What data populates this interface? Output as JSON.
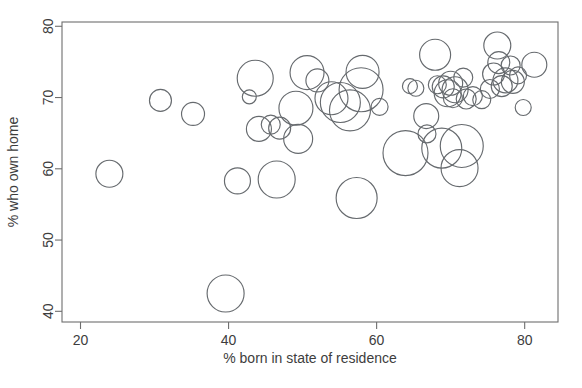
{
  "chart_data": {
    "type": "scatter",
    "title": "",
    "xlabel": "% born in state of residence",
    "ylabel": "% who own home",
    "xlim": [
      17.5,
      84.5
    ],
    "ylim": [
      38.5,
      80.6
    ],
    "xticks": [
      20,
      40,
      60,
      80
    ],
    "yticks": [
      40,
      50,
      60,
      70,
      80
    ],
    "grid": false,
    "legend": null,
    "marker": "open-circle",
    "size_encoding": "bubble radius encodes a third variable (e.g. population)",
    "points": [
      {
        "x": 23.9,
        "y": 59.3,
        "r": 13.5
      },
      {
        "x": 30.8,
        "y": 69.6,
        "r": 11.0
      },
      {
        "x": 35.2,
        "y": 67.7,
        "r": 11.5
      },
      {
        "x": 39.6,
        "y": 42.5,
        "r": 18.5
      },
      {
        "x": 41.2,
        "y": 58.3,
        "r": 13.0
      },
      {
        "x": 42.8,
        "y": 70.1,
        "r": 7.0
      },
      {
        "x": 43.6,
        "y": 72.7,
        "r": 18.0
      },
      {
        "x": 44.1,
        "y": 65.6,
        "r": 12.5
      },
      {
        "x": 45.7,
        "y": 66.2,
        "r": 9.5
      },
      {
        "x": 46.5,
        "y": 58.5,
        "r": 18.5
      },
      {
        "x": 46.9,
        "y": 65.7,
        "r": 11.0
      },
      {
        "x": 49.4,
        "y": 64.2,
        "r": 14.5
      },
      {
        "x": 49.1,
        "y": 68.5,
        "r": 17.0
      },
      {
        "x": 50.6,
        "y": 73.5,
        "r": 17.0
      },
      {
        "x": 52.0,
        "y": 72.4,
        "r": 11.5
      },
      {
        "x": 53.9,
        "y": 69.9,
        "r": 16.5
      },
      {
        "x": 55.1,
        "y": 69.3,
        "r": 20.0
      },
      {
        "x": 56.4,
        "y": 68.2,
        "r": 20.5
      },
      {
        "x": 57.3,
        "y": 55.9,
        "r": 20.5
      },
      {
        "x": 57.9,
        "y": 71.1,
        "r": 22.0
      },
      {
        "x": 58.1,
        "y": 73.6,
        "r": 16.5
      },
      {
        "x": 60.4,
        "y": 68.7,
        "r": 8.5
      },
      {
        "x": 63.9,
        "y": 62.2,
        "r": 22.5
      },
      {
        "x": 64.5,
        "y": 71.6,
        "r": 7.5
      },
      {
        "x": 65.3,
        "y": 71.3,
        "r": 8.0
      },
      {
        "x": 66.7,
        "y": 67.4,
        "r": 12.5
      },
      {
        "x": 66.8,
        "y": 64.9,
        "r": 9.0
      },
      {
        "x": 67.9,
        "y": 76.0,
        "r": 15.5
      },
      {
        "x": 68.2,
        "y": 71.8,
        "r": 9.0
      },
      {
        "x": 68.8,
        "y": 62.9,
        "r": 20.0
      },
      {
        "x": 69.0,
        "y": 71.5,
        "r": 11.0
      },
      {
        "x": 69.6,
        "y": 70.6,
        "r": 13.5
      },
      {
        "x": 70.0,
        "y": 72.0,
        "r": 12.0
      },
      {
        "x": 70.3,
        "y": 69.9,
        "r": 9.5
      },
      {
        "x": 70.6,
        "y": 71.1,
        "r": 13.0
      },
      {
        "x": 71.2,
        "y": 60.1,
        "r": 18.5
      },
      {
        "x": 71.5,
        "y": 63.2,
        "r": 21.5
      },
      {
        "x": 71.7,
        "y": 72.8,
        "r": 9.5
      },
      {
        "x": 72.1,
        "y": 69.8,
        "r": 10.0
      },
      {
        "x": 73.0,
        "y": 70.2,
        "r": 9.5
      },
      {
        "x": 74.2,
        "y": 69.7,
        "r": 9.0
      },
      {
        "x": 75.3,
        "y": 71.2,
        "r": 9.5
      },
      {
        "x": 75.8,
        "y": 73.3,
        "r": 11.0
      },
      {
        "x": 76.3,
        "y": 77.3,
        "r": 13.5
      },
      {
        "x": 76.5,
        "y": 74.9,
        "r": 11.0
      },
      {
        "x": 76.9,
        "y": 71.6,
        "r": 10.5
      },
      {
        "x": 77.4,
        "y": 72.4,
        "r": 12.5
      },
      {
        "x": 78.1,
        "y": 74.5,
        "r": 9.5
      },
      {
        "x": 78.4,
        "y": 72.2,
        "r": 11.5
      },
      {
        "x": 79.1,
        "y": 73.1,
        "r": 8.5
      },
      {
        "x": 79.8,
        "y": 68.6,
        "r": 8.0
      },
      {
        "x": 81.3,
        "y": 74.6,
        "r": 12.5
      }
    ]
  },
  "axes": {
    "x_tick_labels": [
      "20",
      "40",
      "60",
      "80"
    ],
    "y_tick_labels": [
      "40",
      "50",
      "60",
      "70",
      "80"
    ],
    "x_axis_title": "% born in state of residence",
    "y_axis_title": "% who own home"
  },
  "style": {
    "bubble_stroke": "#666a6e",
    "axis_color": "#6e6e6e",
    "text_color": "#3d3d3d",
    "background": "#ffffff"
  }
}
